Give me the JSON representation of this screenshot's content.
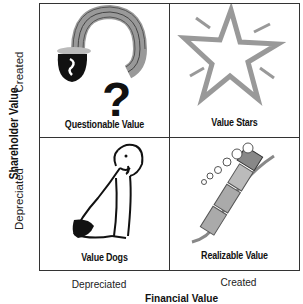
{
  "matrix": {
    "y_axis": {
      "title": "Shareholder Value",
      "ticks": [
        "Created",
        "Depreciated"
      ]
    },
    "x_axis": {
      "title": "Financial Value",
      "ticks": [
        "Depreciated",
        "Created"
      ]
    },
    "quadrants": [
      {
        "position": "top-left",
        "label": "Questionable Value",
        "icon": "pot-of-gold-rainbow-question-icon"
      },
      {
        "position": "top-right",
        "label": "Value Stars",
        "icon": "star-icon"
      },
      {
        "position": "bottom-left",
        "label": "Value Dogs",
        "icon": "dog-icon"
      },
      {
        "position": "bottom-right",
        "label": "Realizable Value",
        "icon": "train-icon"
      }
    ]
  },
  "colors": {
    "line": "#333333",
    "gray": "#9a9a9a",
    "black": "#111111"
  }
}
